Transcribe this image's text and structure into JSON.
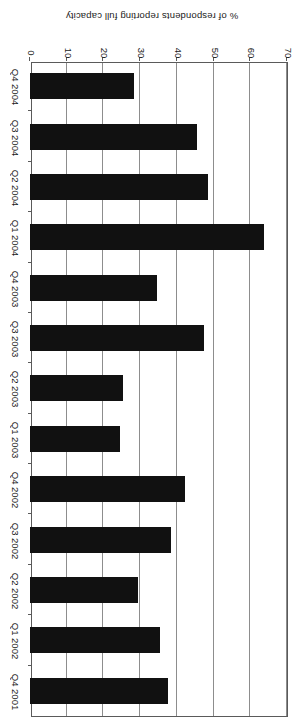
{
  "chart_data": {
    "type": "bar",
    "orientation": "horizontal",
    "title": "",
    "xlabel": "",
    "ylabel": "% of respondents reporting full capacity",
    "value_axis_label": "% of respondents reporting full capacity",
    "categories": [
      "Q4 2001",
      "Q1 2002",
      "Q2 2002",
      "Q3 2002",
      "Q4 2002",
      "Q1 2003",
      "Q2 2003",
      "Q3 2003",
      "Q4 2003",
      "Q1 2004",
      "Q2 2004",
      "Q3 2004",
      "Q4 2004"
    ],
    "values": [
      37.7,
      35.5,
      29.5,
      38.3,
      42.1,
      24.6,
      25.4,
      47.3,
      34.7,
      63.7,
      48.4,
      45.4,
      28.4
    ],
    "ticks": [
      0,
      10,
      20,
      30,
      40,
      50,
      60,
      70
    ],
    "tick_labels": [
      "0",
      "10",
      "20",
      "30",
      "40",
      "50",
      "60",
      "70"
    ],
    "ylim": [
      0,
      70
    ],
    "grid": true,
    "grid_axis": "value",
    "legend": "none",
    "bar_color": "#111111",
    "axis_color": "#5a5a5a",
    "grid_color": "#8d8d8d",
    "page_rotation_degrees": 180
  }
}
